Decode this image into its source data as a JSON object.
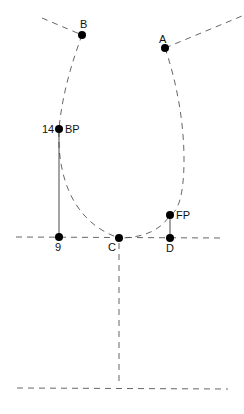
{
  "diagram": {
    "type": "pattern-draft",
    "colors": {
      "line": "#555555",
      "point": "#000000",
      "background": "#ffffff"
    },
    "points": [
      {
        "id": "B",
        "label": "B",
        "x": 82,
        "y": 35
      },
      {
        "id": "A",
        "label": "A",
        "x": 165,
        "y": 48
      },
      {
        "id": "BP",
        "label": "BP",
        "prefix": "14",
        "x": 59,
        "y": 129
      },
      {
        "id": "9",
        "label": "9",
        "x": 59,
        "y": 237
      },
      {
        "id": "C",
        "label": "C",
        "x": 119,
        "y": 238
      },
      {
        "id": "D",
        "label": "D",
        "x": 170,
        "y": 238
      },
      {
        "id": "FP",
        "label": "FP",
        "x": 170,
        "y": 215
      }
    ],
    "labels": {
      "B": "B",
      "A": "A",
      "bp_number": "14",
      "BP": "BP",
      "nine": "9",
      "C": "C",
      "D": "D",
      "FP": "FP"
    }
  }
}
